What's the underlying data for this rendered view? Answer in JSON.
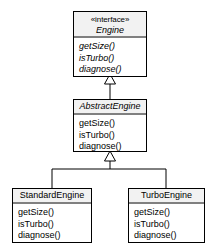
{
  "diagram": {
    "type": "uml-class-diagram",
    "background_color": "#ffffff",
    "line_color": "#000000",
    "header_fill": "#f2f2f2",
    "classes": [
      {
        "id": "engine",
        "stereotype": "«interface»",
        "name": "Engine",
        "italic_name": true,
        "italic_members": true,
        "members": [
          "getSize()",
          "isTurbo()",
          "diagnose()"
        ]
      },
      {
        "id": "abstract_engine",
        "stereotype": "",
        "name": "AbstractEngine",
        "italic_name": true,
        "italic_members": false,
        "members": [
          "getSize()",
          "isTurbo()",
          "diagnose()"
        ]
      },
      {
        "id": "standard_engine",
        "stereotype": "",
        "name": "StandardEngine",
        "italic_name": false,
        "italic_members": false,
        "members": [
          "getSize()",
          "isTurbo()",
          "diagnose()"
        ]
      },
      {
        "id": "turbo_engine",
        "stereotype": "",
        "name": "TurboEngine",
        "italic_name": false,
        "italic_members": false,
        "members": [
          "getSize()",
          "isTurbo()",
          "diagnose()"
        ]
      }
    ],
    "relationships": [
      {
        "id": "realization",
        "kind": "generalization",
        "from": "AbstractEngine",
        "to": "Engine",
        "arrow": "hollow-triangle"
      },
      {
        "id": "inherit-standard",
        "kind": "generalization",
        "from": "StandardEngine",
        "to": "AbstractEngine",
        "arrow": "hollow-triangle"
      },
      {
        "id": "inherit-turbo",
        "kind": "generalization",
        "from": "TurboEngine",
        "to": "AbstractEngine",
        "arrow": "hollow-triangle"
      }
    ]
  }
}
